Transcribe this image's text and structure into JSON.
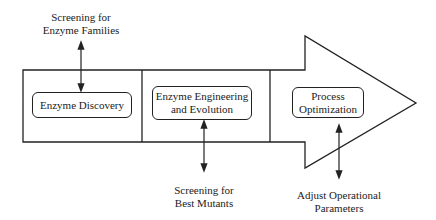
{
  "diagram": {
    "stages": [
      {
        "label": "Enzyme Discovery"
      },
      {
        "label_line1": "Enzyme Engineering",
        "label_line2": "and Evolution"
      },
      {
        "label_line1": "Process",
        "label_line2": "Optimization"
      }
    ],
    "annotations": [
      {
        "line1": "Screening for",
        "line2": "Enzyme Families",
        "position": "above",
        "stage": 1
      },
      {
        "line1": "Screening for",
        "line2": "Best Mutants",
        "position": "below",
        "stage": 2
      },
      {
        "line1": "Adjust Operational",
        "line2": "Parameters",
        "position": "below",
        "stage": 3
      }
    ],
    "colors": {
      "stroke": "#222222",
      "background": "#ffffff"
    }
  }
}
